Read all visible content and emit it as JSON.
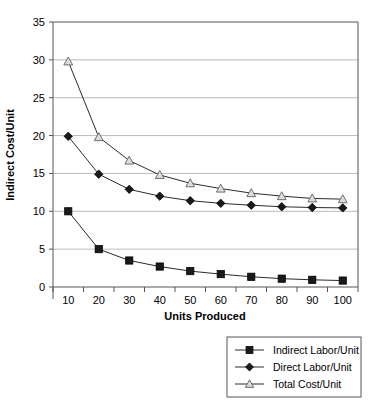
{
  "chart_data": {
    "type": "line",
    "title": "",
    "xlabel": "Units Produced",
    "ylabel": "Indirect Cost/Unit",
    "categories": [
      10,
      20,
      30,
      40,
      50,
      60,
      70,
      80,
      90,
      100
    ],
    "x_tick_labels": [
      "10",
      "20",
      "30",
      "40",
      "50",
      "60",
      "70",
      "80",
      "90",
      "100"
    ],
    "y_tick_labels": [
      "0",
      "5",
      "10",
      "15",
      "20",
      "25",
      "30",
      "35"
    ],
    "y_ticks": [
      0,
      5,
      10,
      15,
      20,
      25,
      30,
      35
    ],
    "ylim": [
      0,
      35
    ],
    "grid": "horizontal",
    "legend_position": "bottom-right",
    "series": [
      {
        "name": "Indirect Labor/Unit",
        "marker": "filled-square",
        "color": "#1a1a1a",
        "values": [
          10.0,
          5.0,
          3.5,
          2.7,
          2.1,
          1.7,
          1.35,
          1.1,
          0.95,
          0.85
        ]
      },
      {
        "name": "Direct Labor/Unit",
        "marker": "filled-diamond",
        "color": "#1a1a1a",
        "values": [
          19.9,
          14.9,
          12.9,
          12.0,
          11.4,
          11.05,
          10.8,
          10.6,
          10.5,
          10.45
        ]
      },
      {
        "name": "Total Cost/Unit",
        "marker": "open-triangle",
        "color": "#8c8c8c",
        "values": [
          29.8,
          19.8,
          16.7,
          14.8,
          13.7,
          13.0,
          12.4,
          12.0,
          11.7,
          11.6
        ]
      }
    ]
  },
  "legend": {
    "items": [
      {
        "label": "Indirect Labor/Unit",
        "marker": "filled-square"
      },
      {
        "label": "Direct Labor/Unit",
        "marker": "filled-diamond"
      },
      {
        "label": "Total Cost/Unit",
        "marker": "open-triangle"
      }
    ]
  },
  "colors": {
    "gridline": "#a9a9a9",
    "axis": "#555555",
    "line": "#2b2b2b",
    "marker_dark": "#1a1a1a",
    "marker_light": "#9a9a9a",
    "background": "#ffffff"
  }
}
